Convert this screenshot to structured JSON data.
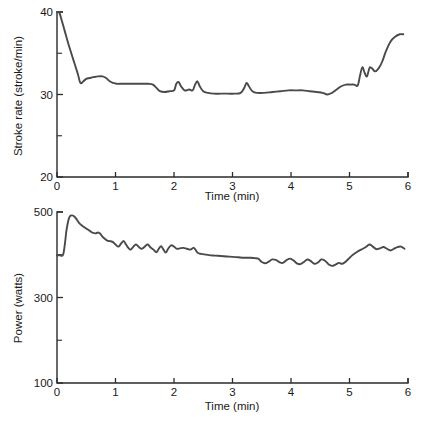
{
  "figure": {
    "caption": "",
    "line_color": "#4a4a4a",
    "axis_color": "#2b2b2b",
    "background": "#ffffff"
  },
  "chart_data": [
    {
      "id": "stroke-rate",
      "type": "line",
      "title": "",
      "xlabel": "Time (min)",
      "ylabel": "Stroke rate (stroke/min)",
      "xlim": [
        0,
        6
      ],
      "ylim": [
        20,
        40
      ],
      "xticks": [
        0,
        1,
        2,
        3,
        4,
        5,
        6
      ],
      "xticklabels": [
        "0",
        "1",
        "2",
        "3",
        "4",
        "5",
        "6"
      ],
      "yticks": [
        20,
        30,
        40
      ],
      "yticklabels": [
        "20",
        "30",
        "40"
      ],
      "yminorticks": [
        25,
        35
      ],
      "grid": false,
      "legend": null,
      "series": [
        {
          "name": "Stroke rate",
          "x": [
            0.0,
            0.04,
            0.08,
            0.12,
            0.16,
            0.2,
            0.24,
            0.28,
            0.32,
            0.36,
            0.4,
            0.45,
            0.5,
            0.56,
            0.62,
            0.7,
            0.78,
            0.84,
            0.9,
            0.96,
            1.02,
            1.1,
            1.2,
            1.32,
            1.44,
            1.56,
            1.64,
            1.7,
            1.76,
            1.84,
            1.92,
            2.0,
            2.04,
            2.08,
            2.12,
            2.18,
            2.26,
            2.32,
            2.36,
            2.4,
            2.44,
            2.5,
            2.58,
            2.68,
            2.8,
            2.92,
            3.04,
            3.14,
            3.2,
            3.24,
            3.28,
            3.34,
            3.42,
            3.54,
            3.68,
            3.82,
            3.96,
            4.08,
            4.2,
            4.32,
            4.44,
            4.54,
            4.62,
            4.7,
            4.78,
            4.86,
            4.94,
            5.02,
            5.08,
            5.14,
            5.18,
            5.22,
            5.26,
            5.3,
            5.34,
            5.38,
            5.44,
            5.5,
            5.56,
            5.62,
            5.7,
            5.78,
            5.86,
            5.92
          ],
          "y": [
            40.0,
            39.9,
            39.0,
            38.0,
            37.0,
            36.0,
            35.1,
            34.2,
            33.3,
            32.4,
            31.4,
            31.6,
            31.9,
            32.0,
            32.1,
            32.2,
            32.2,
            32.0,
            31.6,
            31.4,
            31.3,
            31.3,
            31.3,
            31.3,
            31.3,
            31.3,
            31.2,
            30.8,
            30.4,
            30.3,
            30.4,
            30.5,
            31.3,
            31.5,
            31.0,
            30.5,
            30.6,
            30.5,
            31.2,
            31.6,
            31.0,
            30.4,
            30.2,
            30.1,
            30.1,
            30.1,
            30.1,
            30.2,
            30.8,
            31.4,
            31.0,
            30.4,
            30.2,
            30.2,
            30.3,
            30.4,
            30.5,
            30.5,
            30.5,
            30.4,
            30.3,
            30.2,
            30.0,
            30.2,
            30.6,
            31.0,
            31.2,
            31.2,
            31.2,
            31.1,
            32.3,
            33.3,
            32.6,
            32.2,
            33.2,
            33.2,
            32.8,
            33.2,
            34.0,
            35.2,
            36.4,
            37.0,
            37.3,
            37.3
          ]
        }
      ]
    },
    {
      "id": "power",
      "type": "line",
      "title": "",
      "xlabel": "Time (min)",
      "ylabel": "Power (watts)",
      "xlim": [
        0,
        6
      ],
      "ylim": [
        100,
        500
      ],
      "xticks": [
        0,
        1,
        2,
        3,
        4,
        5,
        6
      ],
      "xticklabels": [
        "0",
        "1",
        "2",
        "3",
        "4",
        "5",
        "6"
      ],
      "yticks": [
        100,
        300,
        500
      ],
      "yticklabels": [
        "100",
        "300",
        "500"
      ],
      "yminorticks": [
        200,
        400
      ],
      "grid": false,
      "legend": null,
      "series": [
        {
          "name": "Power",
          "x": [
            0.0,
            0.05,
            0.1,
            0.13,
            0.16,
            0.19,
            0.22,
            0.26,
            0.3,
            0.34,
            0.38,
            0.43,
            0.48,
            0.54,
            0.6,
            0.66,
            0.7,
            0.74,
            0.78,
            0.82,
            0.86,
            0.9,
            0.95,
            1.0,
            1.05,
            1.1,
            1.14,
            1.18,
            1.22,
            1.26,
            1.3,
            1.35,
            1.4,
            1.45,
            1.5,
            1.55,
            1.6,
            1.65,
            1.7,
            1.74,
            1.78,
            1.82,
            1.86,
            1.9,
            1.95,
            2.0,
            2.05,
            2.1,
            2.16,
            2.22,
            2.28,
            2.34,
            2.4,
            2.46,
            2.52,
            2.6,
            2.7,
            2.8,
            2.9,
            3.0,
            3.1,
            3.2,
            3.3,
            3.38,
            3.44,
            3.5,
            3.56,
            3.62,
            3.68,
            3.74,
            3.8,
            3.86,
            3.92,
            3.98,
            4.04,
            4.1,
            4.16,
            4.22,
            4.28,
            4.34,
            4.4,
            4.46,
            4.52,
            4.58,
            4.64,
            4.7,
            4.76,
            4.82,
            4.88,
            4.96,
            5.04,
            5.12,
            5.2,
            5.28,
            5.34,
            5.4,
            5.46,
            5.52,
            5.58,
            5.64,
            5.7,
            5.76,
            5.82,
            5.88,
            5.94
          ],
          "y": [
            399,
            399,
            399,
            420,
            455,
            478,
            490,
            492,
            489,
            482,
            474,
            468,
            463,
            458,
            452,
            450,
            452,
            449,
            442,
            437,
            433,
            432,
            430,
            424,
            419,
            427,
            432,
            424,
            416,
            412,
            418,
            424,
            418,
            414,
            419,
            424,
            417,
            412,
            406,
            414,
            420,
            412,
            405,
            414,
            422,
            419,
            414,
            415,
            416,
            414,
            412,
            416,
            405,
            402,
            401,
            399,
            398,
            397,
            396,
            395,
            394,
            393,
            393,
            392,
            391,
            383,
            380,
            384,
            389,
            388,
            383,
            381,
            387,
            391,
            387,
            380,
            378,
            383,
            389,
            385,
            379,
            382,
            389,
            386,
            378,
            374,
            377,
            381,
            379,
            387,
            398,
            406,
            412,
            418,
            424,
            419,
            413,
            415,
            418,
            414,
            410,
            414,
            418,
            419,
            414
          ]
        }
      ]
    }
  ]
}
